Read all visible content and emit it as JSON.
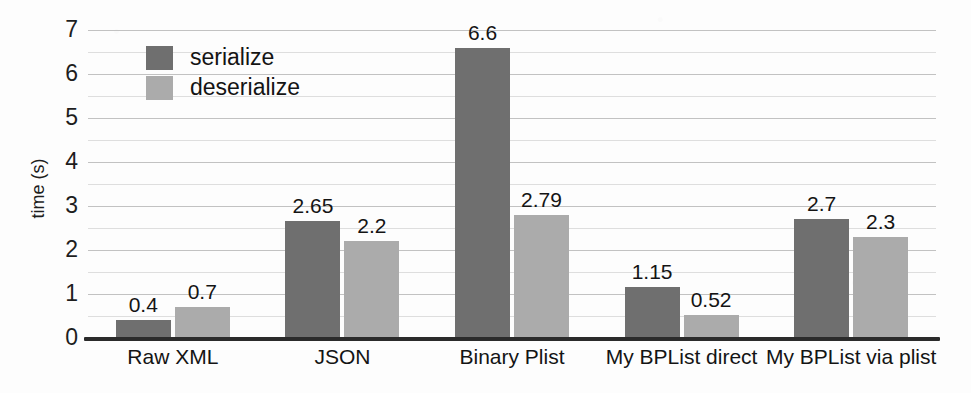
{
  "chart_data": {
    "type": "bar",
    "title": "",
    "xlabel": "",
    "ylabel": "time (s)",
    "ylim": [
      0,
      7
    ],
    "ytick_labels": [
      "0",
      "1",
      "2",
      "3",
      "4",
      "5",
      "6",
      "7"
    ],
    "grid": true,
    "grid_major_step": 1,
    "grid_minor_step": 0.5,
    "legend_position": "top-left",
    "categories": [
      "Raw XML",
      "JSON",
      "Binary Plist",
      "My BPList direct",
      "My BPList via plist"
    ],
    "series": [
      {
        "name": "serialize",
        "color": "#6f6f6f",
        "values": [
          0.4,
          2.65,
          6.6,
          1.15,
          2.7
        ],
        "labels": [
          "0.4",
          "2.65",
          "6.6",
          "1.15",
          "2.7"
        ]
      },
      {
        "name": "deserialize",
        "color": "#ababab",
        "values": [
          0.7,
          2.2,
          2.79,
          0.52,
          2.3
        ],
        "labels": [
          "0.7",
          "2.2",
          "2.79",
          "0.52",
          "2.3"
        ]
      }
    ]
  },
  "legend": {
    "items": [
      {
        "label": "serialize",
        "color": "#6f6f6f"
      },
      {
        "label": "deserialize",
        "color": "#ababab"
      }
    ]
  },
  "axes": {
    "y_title": "time (s)",
    "y_ticks": [
      "7",
      "6",
      "5",
      "4",
      "3",
      "2",
      "1",
      "0"
    ]
  },
  "colors": {
    "serialize": "#6f6f6f",
    "deserialize": "#ababab",
    "background": "#fdfdfd",
    "axis": "#2b2b2b",
    "gridline_major": "#c2c2c2",
    "gridline_minor": "#dedede",
    "text": "#141414"
  }
}
